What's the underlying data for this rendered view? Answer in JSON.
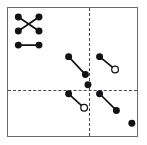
{
  "figure": {
    "title": "",
    "caption": "",
    "background_color": "#ffffff",
    "frame_color": "#6a6a72",
    "axis_color": "#4a4a52",
    "marker_fill_color": "#121214",
    "marker_open_color": "#ffffff"
  },
  "chart_data": {
    "type": "scatter",
    "title": "",
    "xlabel": "",
    "ylabel": "",
    "xlim": [
      0,
      100
    ],
    "ylim": [
      0,
      100
    ],
    "grid": false,
    "legend": null,
    "axes": {
      "vertical_divider_x": 63,
      "horizontal_divider_y": 36,
      "style": "dashed"
    },
    "marker_styles": [
      {
        "name": "filled-filled",
        "start": "filled",
        "end": "filled"
      },
      {
        "name": "filled-open",
        "start": "filled",
        "end": "open"
      },
      {
        "name": "single-filled",
        "start": "filled",
        "end": null
      }
    ],
    "legend_cluster": {
      "name": "marker-type-cluster",
      "rows": 3,
      "cols": 2,
      "nodes": [
        {
          "id": "L1",
          "x": 8,
          "y": 93,
          "style": "filled"
        },
        {
          "id": "L2",
          "x": 24,
          "y": 93,
          "style": "filled"
        },
        {
          "id": "L3",
          "x": 8,
          "y": 82,
          "style": "filled"
        },
        {
          "id": "L4",
          "x": 24,
          "y": 82,
          "style": "filled"
        },
        {
          "id": "L5",
          "x": 8,
          "y": 71,
          "style": "filled"
        },
        {
          "id": "L6",
          "x": 24,
          "y": 71,
          "style": "filled"
        }
      ],
      "segments": [
        {
          "id": "LS1",
          "from": "L1",
          "to": "L4",
          "orientation": "diagonal-down"
        },
        {
          "id": "LS2",
          "from": "L2",
          "to": "L3",
          "orientation": "vertical"
        },
        {
          "id": "LS3",
          "from": "L5",
          "to": "L6",
          "orientation": "horizontal"
        }
      ]
    },
    "segments": [
      {
        "id": "S1",
        "quadrant": "upper-left",
        "from": {
          "x": 47,
          "y": 62,
          "style": "filled"
        },
        "to": {
          "x": 60,
          "y": 48,
          "style": "filled"
        }
      },
      {
        "id": "S2",
        "quadrant": "upper-right",
        "from": {
          "x": 71,
          "y": 62,
          "style": "filled"
        },
        "to": {
          "x": 83,
          "y": 52,
          "style": "open"
        }
      },
      {
        "id": "S3",
        "quadrant": "lower-left",
        "from": {
          "x": 47,
          "y": 33,
          "style": "filled"
        },
        "to": {
          "x": 59,
          "y": 22,
          "style": "open"
        }
      },
      {
        "id": "S4",
        "quadrant": "lower-right",
        "from": {
          "x": 71,
          "y": 33,
          "style": "filled"
        },
        "to": {
          "x": 84,
          "y": 20,
          "style": "filled"
        }
      }
    ],
    "points": [
      {
        "id": "P1",
        "x": 62,
        "y": 40,
        "style": "filled",
        "quadrant": "upper-left"
      },
      {
        "id": "P2",
        "x": 96,
        "y": 10,
        "style": "filled",
        "quadrant": "lower-right"
      }
    ]
  }
}
